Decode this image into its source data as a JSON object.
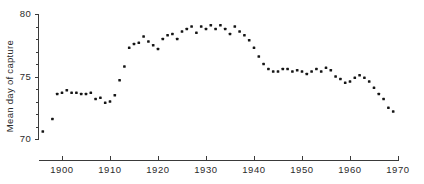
{
  "chart_data": {
    "type": "scatter",
    "title": "",
    "subtitle": "",
    "xlabel": "",
    "ylabel": "Mean day of capture",
    "xlim": [
      1894,
      1971
    ],
    "ylim": [
      70,
      80
    ],
    "grid": false,
    "legend": null,
    "x_ticks": [
      1900,
      1910,
      1920,
      1930,
      1940,
      1950,
      1960,
      1970
    ],
    "x_tick_labels": [
      "1900",
      "1910",
      "1920",
      "1930",
      "1940",
      "1950",
      "1960",
      "1970"
    ],
    "x_minor_tick_interval": 0,
    "y_ticks": [
      70,
      75,
      80
    ],
    "y_tick_labels": [
      "70",
      "75",
      "80"
    ],
    "y_minor_ticks": [
      71,
      72,
      73,
      74,
      76,
      77,
      78,
      79
    ],
    "marker": "filled-square-dot",
    "marker_color": "#151515",
    "marker_size_px": 2.6,
    "series": [
      {
        "name": "Mean day of capture",
        "x": [
          1896,
          1898,
          1899,
          1900,
          1901,
          1902,
          1903,
          1904,
          1905,
          1906,
          1907,
          1908,
          1909,
          1910,
          1911,
          1912,
          1913,
          1914,
          1915,
          1916,
          1917,
          1918,
          1919,
          1920,
          1921,
          1922,
          1923,
          1924,
          1925,
          1926,
          1927,
          1928,
          1929,
          1930,
          1931,
          1932,
          1933,
          1934,
          1935,
          1936,
          1937,
          1938,
          1939,
          1940,
          1941,
          1942,
          1943,
          1944,
          1945,
          1946,
          1947,
          1948,
          1949,
          1950,
          1951,
          1952,
          1953,
          1954,
          1955,
          1956,
          1957,
          1958,
          1959,
          1960,
          1961,
          1962,
          1963,
          1964,
          1965,
          1966,
          1967,
          1968,
          1969
        ],
        "y": [
          70.6,
          71.6,
          73.6,
          73.7,
          73.9,
          73.7,
          73.7,
          73.6,
          73.6,
          73.7,
          73.2,
          73.3,
          72.9,
          73.0,
          73.5,
          74.7,
          75.8,
          77.3,
          77.6,
          77.7,
          78.2,
          77.8,
          77.5,
          77.2,
          78.0,
          78.3,
          78.4,
          78.0,
          78.6,
          78.8,
          79.0,
          78.5,
          79.0,
          78.8,
          79.1,
          78.8,
          79.1,
          78.8,
          78.4,
          79.0,
          78.6,
          78.3,
          77.9,
          77.3,
          76.6,
          76.0,
          75.6,
          75.4,
          75.4,
          75.6,
          75.6,
          75.4,
          75.5,
          75.4,
          75.2,
          75.4,
          75.6,
          75.4,
          75.7,
          75.5,
          75.0,
          74.8,
          74.5,
          74.6,
          74.9,
          75.1,
          74.9,
          74.6,
          74.1,
          73.6,
          73.2,
          72.5,
          72.2
        ]
      }
    ]
  },
  "axes": {
    "y_axis_title": "Mean day of capture"
  }
}
